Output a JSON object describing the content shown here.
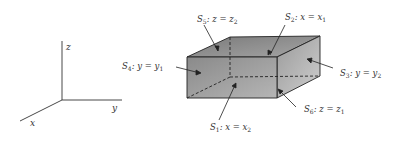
{
  "axes": {
    "x_label": "x",
    "y_label": "y",
    "z_label": "z"
  },
  "box": {
    "vertices": {
      "front_top_left": [
        187,
        57
      ],
      "front_top_right": [
        277,
        57
      ],
      "front_bottom_left": [
        187,
        98
      ],
      "front_bottom_right": [
        277,
        98
      ],
      "back_top_left": [
        230,
        37
      ],
      "back_top_right": [
        320,
        36
      ],
      "back_bottom_left": [
        230,
        77
      ],
      "back_bottom_right": [
        320,
        76
      ]
    },
    "colors": {
      "front_face": "#9a9a9a",
      "top_face": "#8c8c8c",
      "side_face": "#a8a8a8",
      "edge": "#222222"
    }
  },
  "faces": [
    {
      "id": "S1",
      "name": "S",
      "index": "1",
      "eq_lhs": "x",
      "eq_rhs": "x",
      "eq_sub": "2"
    },
    {
      "id": "S2",
      "name": "S",
      "index": "2",
      "eq_lhs": "x",
      "eq_rhs": "x",
      "eq_sub": "1"
    },
    {
      "id": "S3",
      "name": "S",
      "index": "3",
      "eq_lhs": "y",
      "eq_rhs": "y",
      "eq_sub": "2"
    },
    {
      "id": "S4",
      "name": "S",
      "index": "4",
      "eq_lhs": "y",
      "eq_rhs": "y",
      "eq_sub": "1"
    },
    {
      "id": "S5",
      "name": "S",
      "index": "5",
      "eq_lhs": "z",
      "eq_rhs": "z",
      "eq_sub": "2"
    },
    {
      "id": "S6",
      "name": "S",
      "index": "6",
      "eq_lhs": "z",
      "eq_rhs": "z",
      "eq_sub": "1"
    }
  ]
}
